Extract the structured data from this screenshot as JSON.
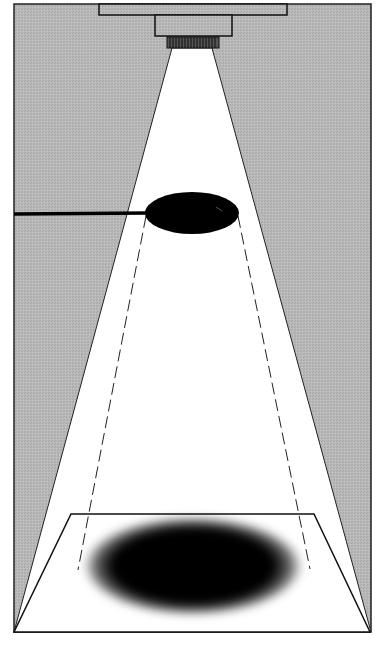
{
  "diagram": {
    "title": "",
    "colors": {
      "background_gray": "#b4b4b4",
      "beam": "#ffffff",
      "outline": "#111111",
      "object": "#000000",
      "shadow": "#000000"
    },
    "elements": [
      {
        "id": "ceiling-mount",
        "label": ""
      },
      {
        "id": "lamp-housing",
        "label": ""
      },
      {
        "id": "lens-ring",
        "label": ""
      },
      {
        "id": "light-cone",
        "label": ""
      },
      {
        "id": "occluding-disc",
        "label": ""
      },
      {
        "id": "support-rod",
        "label": ""
      },
      {
        "id": "projection-lines",
        "label": ""
      },
      {
        "id": "floor-plane",
        "label": ""
      },
      {
        "id": "cast-shadow",
        "label": ""
      }
    ]
  }
}
